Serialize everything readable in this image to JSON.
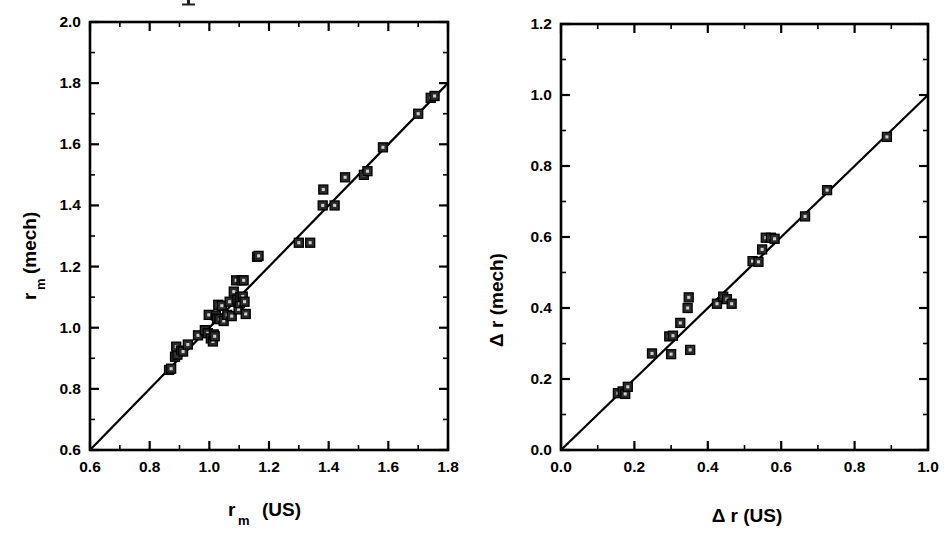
{
  "figure": {
    "background_color": "#ffffff",
    "marker_color": "#2b2b2b",
    "line_color": "#000000",
    "artifact_label": "scan-artifact-mark"
  },
  "chart_data": [
    {
      "type": "scatter",
      "id": "left",
      "title": "",
      "xlabel": "r_m  (US)",
      "xlabel_main": "r",
      "xlabel_sub": "m",
      "xlabel_tail": "(US)",
      "ylabel": "r_m  (mech)",
      "ylabel_main": "r",
      "ylabel_sub": "m",
      "ylabel_tail": "(mech)",
      "xlim": [
        0.6,
        1.8
      ],
      "ylim": [
        0.6,
        2.0
      ],
      "xticks": [
        0.6,
        0.8,
        1.0,
        1.2,
        1.4,
        1.6,
        1.8
      ],
      "yticks": [
        0.6,
        0.8,
        1.0,
        1.2,
        1.4,
        1.6,
        1.8,
        2.0
      ],
      "xticklabels": [
        "0.6",
        "0.8",
        "1.0",
        "1.2",
        "1.4",
        "1.6",
        "1.8"
      ],
      "yticklabels": [
        "0.6",
        "0.8",
        "1.0",
        "1.2",
        "1.4",
        "1.6",
        "1.8",
        "2.0"
      ],
      "minor_tick_step": 0.1,
      "grid": false,
      "legend": null,
      "fit_line": {
        "label": "identity-line",
        "x": [
          0.6,
          1.8
        ],
        "y": [
          0.6,
          1.8
        ]
      },
      "points": [
        [
          0.865,
          0.862
        ],
        [
          0.872,
          0.866
        ],
        [
          0.885,
          0.905
        ],
        [
          0.893,
          0.912
        ],
        [
          0.889,
          0.938
        ],
        [
          0.905,
          0.925
        ],
        [
          0.912,
          0.922
        ],
        [
          0.928,
          0.945
        ],
        [
          0.962,
          0.975
        ],
        [
          0.985,
          0.992
        ],
        [
          0.995,
          0.982
        ],
        [
          0.998,
          1.042
        ],
        [
          1.005,
          0.965
        ],
        [
          1.012,
          0.955
        ],
        [
          1.015,
          0.978
        ],
        [
          1.018,
          0.972
        ],
        [
          1.022,
          1.04
        ],
        [
          1.026,
          1.03
        ],
        [
          1.03,
          1.075
        ],
        [
          1.034,
          1.028
        ],
        [
          1.042,
          1.072
        ],
        [
          1.048,
          1.022
        ],
        [
          1.06,
          1.042
        ],
        [
          1.068,
          1.085
        ],
        [
          1.075,
          1.038
        ],
        [
          1.082,
          1.118
        ],
        [
          1.09,
          1.155
        ],
        [
          1.094,
          1.092
        ],
        [
          1.098,
          1.06
        ],
        [
          1.102,
          1.08
        ],
        [
          1.104,
          1.1
        ],
        [
          1.108,
          1.155
        ],
        [
          1.112,
          1.102
        ],
        [
          1.115,
          1.155
        ],
        [
          1.118,
          1.085
        ],
        [
          1.122,
          1.045
        ],
        [
          1.16,
          1.232
        ],
        [
          1.165,
          1.235
        ],
        [
          1.3,
          1.278
        ],
        [
          1.338,
          1.278
        ],
        [
          1.38,
          1.4
        ],
        [
          1.382,
          1.452
        ],
        [
          1.42,
          1.4
        ],
        [
          1.455,
          1.492
        ],
        [
          1.518,
          1.5
        ],
        [
          1.53,
          1.512
        ],
        [
          1.582,
          1.59
        ],
        [
          1.7,
          1.7
        ],
        [
          1.742,
          1.752
        ],
        [
          1.755,
          1.758
        ]
      ],
      "point_count": 50
    },
    {
      "type": "scatter",
      "id": "right",
      "title": "",
      "xlabel": "Δ r (US)",
      "ylabel": "Δ r (mech)",
      "xlim": [
        0.0,
        1.0
      ],
      "ylim": [
        0.0,
        1.2
      ],
      "xticks": [
        0.0,
        0.2,
        0.4,
        0.6,
        0.8,
        1.0
      ],
      "yticks": [
        0.0,
        0.2,
        0.4,
        0.6,
        0.8,
        1.0,
        1.2
      ],
      "xticklabels": [
        "0.0",
        "0.2",
        "0.4",
        "0.6",
        "0.8",
        "1.0"
      ],
      "yticklabels": [
        "0.0",
        "0.2",
        "0.4",
        "0.6",
        "0.8",
        "1.0",
        "1.2"
      ],
      "minor_tick_step": 0.1,
      "grid": false,
      "legend": null,
      "fit_line": {
        "label": "identity-line",
        "x": [
          0.0,
          1.0
        ],
        "y": [
          0.0,
          1.0
        ]
      },
      "points": [
        [
          0.155,
          0.16
        ],
        [
          0.168,
          0.165
        ],
        [
          0.175,
          0.158
        ],
        [
          0.182,
          0.178
        ],
        [
          0.248,
          0.272
        ],
        [
          0.295,
          0.32
        ],
        [
          0.3,
          0.27
        ],
        [
          0.305,
          0.322
        ],
        [
          0.325,
          0.358
        ],
        [
          0.345,
          0.4
        ],
        [
          0.348,
          0.43
        ],
        [
          0.352,
          0.282
        ],
        [
          0.425,
          0.412
        ],
        [
          0.442,
          0.432
        ],
        [
          0.452,
          0.425
        ],
        [
          0.465,
          0.412
        ],
        [
          0.522,
          0.532
        ],
        [
          0.538,
          0.53
        ],
        [
          0.548,
          0.565
        ],
        [
          0.558,
          0.598
        ],
        [
          0.572,
          0.598
        ],
        [
          0.582,
          0.595
        ],
        [
          0.665,
          0.658
        ],
        [
          0.725,
          0.732
        ],
        [
          0.888,
          0.882
        ]
      ],
      "point_count": 25
    }
  ]
}
